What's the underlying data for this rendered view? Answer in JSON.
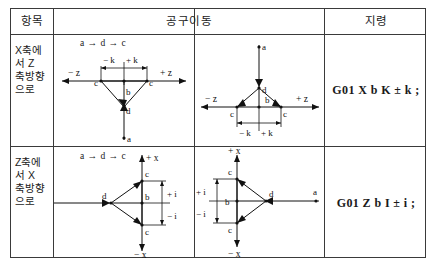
{
  "table": {
    "headers": {
      "item": "항목",
      "tool_move": "공구이동",
      "command": "지령"
    },
    "rows": [
      {
        "label_lines": [
          "X축에",
          "서 Z",
          "축방향",
          "으로"
        ],
        "flow_sequence": "a → d → c",
        "command": "G01 X b K ± k ;",
        "diagrams": [
          {
            "name": "x-to-z-left",
            "axis_negative": "− z",
            "axis_positive": "+ z",
            "dim_negative": "− k",
            "dim_positive": "+ k",
            "points": [
              "c",
              "b",
              "d",
              "a",
              "c"
            ],
            "orientation": "v-down"
          },
          {
            "name": "x-to-z-right",
            "axis_negative": "− z",
            "axis_positive": "+ z",
            "dim_negative": "− k",
            "dim_positive": "+ k",
            "points": [
              "a",
              "d",
              "b",
              "c",
              "c"
            ],
            "orientation": "v-up"
          }
        ]
      },
      {
        "label_lines": [
          "Z축에",
          "서 X",
          "축방향",
          "으로"
        ],
        "flow_sequence": "a → d → c",
        "command": "G01 Z b I ± i ;",
        "diagrams": [
          {
            "name": "z-to-x-left",
            "axis_positive": "+ x",
            "axis_negative": "− x",
            "dim_positive": "+ i",
            "dim_negative": "− i",
            "points": [
              "a",
              "d",
              "b",
              "c",
              "c"
            ],
            "orientation": "v-right"
          },
          {
            "name": "z-to-x-right",
            "axis_positive": "+ x",
            "axis_negative": "− x",
            "dim_positive": "+ i",
            "dim_negative": "− i",
            "points": [
              "c",
              "b",
              "d",
              "a",
              "c"
            ],
            "orientation": "v-left"
          }
        ]
      }
    ]
  },
  "extra_labels": {
    "row2_axis_top_left": "+x",
    "row2_axis_top_right": "+x"
  },
  "colors": {
    "ink": "#1a1a1a",
    "rule": "#3a3a3a",
    "paper": "#ffffff"
  }
}
